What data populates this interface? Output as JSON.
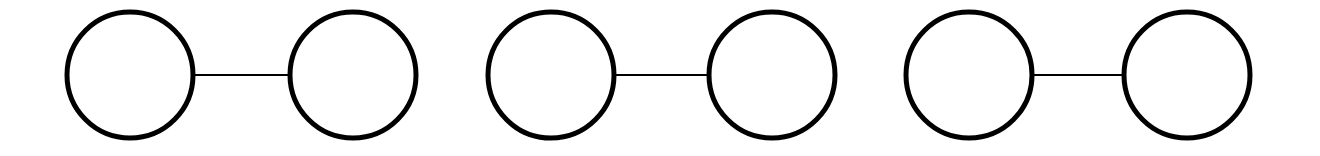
{
  "diagram": {
    "stroke_color": "#000000",
    "fill_color": "#ffffff",
    "node_radius": 63,
    "node_stroke_width": 5,
    "edge_stroke_width": 2,
    "center_y": 75,
    "pairs": [
      {
        "id": "pair-1",
        "nodes": [
          {
            "cx": 130,
            "label": ""
          },
          {
            "cx": 353,
            "label": ""
          }
        ]
      },
      {
        "id": "pair-2",
        "nodes": [
          {
            "cx": 551,
            "label": ""
          },
          {
            "cx": 772,
            "label": ""
          }
        ]
      },
      {
        "id": "pair-3",
        "nodes": [
          {
            "cx": 969,
            "label": ""
          },
          {
            "cx": 1187,
            "label": ""
          }
        ]
      }
    ]
  }
}
